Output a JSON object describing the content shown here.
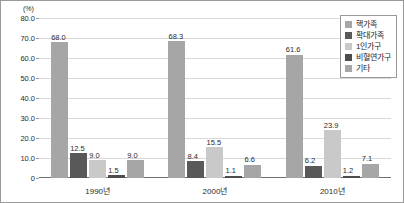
{
  "chart_data": {
    "type": "bar",
    "title": "",
    "xlabel": "",
    "ylabel": "(%)",
    "ylim": [
      0,
      80
    ],
    "yticks": [
      "0",
      "10.0",
      "20.0",
      "30.0",
      "40.0",
      "50.0",
      "60.0",
      "70.0",
      "80.0"
    ],
    "grid": true,
    "legend_position": "top-right",
    "categories": [
      "1990년",
      "2000년",
      "2010년"
    ],
    "series": [
      {
        "name": "핵가족",
        "color": "#a6a6a6",
        "values": [
          68.0,
          68.3,
          61.6
        ],
        "labels": [
          "68.0",
          "68.3",
          "61.6"
        ]
      },
      {
        "name": "확대가족",
        "color": "#595959",
        "values": [
          12.5,
          8.4,
          6.2
        ],
        "labels": [
          "12.5",
          "8.4",
          "6.2"
        ]
      },
      {
        "name": "1인가구",
        "color": "#c9c9c9",
        "values": [
          9.0,
          15.5,
          23.9
        ],
        "labels": [
          "9.0",
          "15.5",
          "23.9"
        ]
      },
      {
        "name": "비혈연가구",
        "color": "#4d4d4d",
        "values": [
          1.5,
          1.1,
          1.2
        ],
        "labels": [
          "1.5",
          "1.1",
          "1.2"
        ]
      },
      {
        "name": "기타",
        "color": "#a6a6a6",
        "values": [
          9.0,
          6.6,
          7.1
        ],
        "labels": [
          "9.0",
          "6.6",
          "7.1"
        ]
      }
    ]
  },
  "colors": {
    "frame_border": "#9a9a9a",
    "gridline": "#d9d9d9",
    "axis": "#6f6f6f",
    "text": "#2b2b2b",
    "background": "#ffffff"
  }
}
